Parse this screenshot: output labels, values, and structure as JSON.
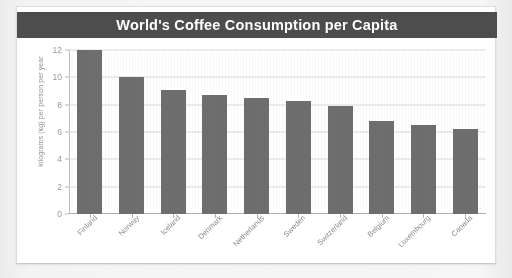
{
  "card": {
    "title": "World's Coffee Consumption per Capita"
  },
  "colors": {
    "title_bar": "#4d4d4d",
    "title_text": "#ffffff",
    "bar": "#6e6e6e",
    "gridline": "#dadada",
    "axis": "#b0b0b0",
    "tick_label": "#9a9a9a",
    "page_background": "#f2f2f2",
    "card_background": "#ffffff"
  },
  "chart_data": {
    "type": "bar",
    "title": "World's Coffee Consumption per Capita",
    "xlabel": "",
    "ylabel": "kilograms (kg) per person per year",
    "ylim": [
      0,
      12
    ],
    "yticks": [
      0,
      2,
      4,
      6,
      8,
      10,
      12
    ],
    "ytick_labels": [
      "0",
      "2",
      "4",
      "6",
      "8",
      "10",
      "12"
    ],
    "grid": true,
    "legend": false,
    "categories": [
      "Finland",
      "Norway",
      "Iceland",
      "Denmark",
      "Netherlands",
      "Sweden",
      "Switzerland",
      "Belgium",
      "Luxembourg",
      "Canada"
    ],
    "values": [
      12.0,
      10.0,
      9.1,
      8.7,
      8.5,
      8.3,
      7.9,
      6.8,
      6.5,
      6.2
    ]
  }
}
